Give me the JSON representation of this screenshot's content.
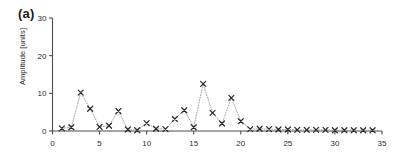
{
  "figure": {
    "panel_label": "(a)",
    "background_color": "#ffffff",
    "axis_color": "#4d4d4d",
    "marker_color": "#2b2b2b",
    "line_color": "#9a9a9a"
  },
  "chart_data": {
    "type": "scatter",
    "title": "",
    "xlabel": "",
    "ylabel": "Amplitude [units]",
    "xlim": [
      0,
      35
    ],
    "ylim": [
      0,
      30
    ],
    "xticks": [
      0,
      5,
      10,
      15,
      20,
      25,
      30,
      35
    ],
    "yticks": [
      0,
      10,
      20,
      30
    ],
    "xtick_labels": [
      "0",
      "5",
      "10",
      "15",
      "20",
      "25",
      "30",
      "35"
    ],
    "ytick_labels": [
      "0",
      "10",
      "20",
      "30"
    ],
    "grid": false,
    "legend": null,
    "marker": "x",
    "linestyle": "dotted",
    "x": [
      1,
      2,
      3,
      4,
      5,
      6,
      7,
      8,
      9,
      10,
      11,
      12,
      13,
      14,
      15,
      16,
      17,
      18,
      19,
      20,
      21,
      22,
      23,
      24,
      25,
      26,
      27,
      28,
      29,
      30,
      31,
      32,
      33,
      34
    ],
    "values": [
      0.7,
      1.0,
      10.2,
      5.9,
      1.1,
      1.4,
      5.3,
      0.4,
      0.2,
      2.1,
      0.6,
      0.5,
      3.2,
      5.5,
      1.0,
      12.5,
      4.8,
      2.0,
      8.8,
      2.6,
      0.5,
      0.6,
      0.5,
      0.4,
      0.4,
      0.3,
      0.3,
      0.3,
      0.3,
      0.2,
      0.2,
      0.2,
      0.2,
      0.2
    ]
  }
}
